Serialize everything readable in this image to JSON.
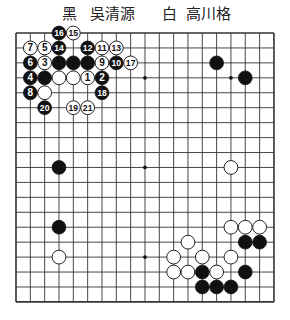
{
  "header": {
    "black_label": "黑",
    "black_player": "吳清源",
    "white_label": "白",
    "white_player": "高川格"
  },
  "board": {
    "size": 19,
    "origin_x": 16,
    "origin_y": 33,
    "spacing_x": 14.33,
    "spacing_y": 14.94,
    "stone_radius": 6.9,
    "line_color": "#333333",
    "star_points": [
      [
        3,
        3
      ],
      [
        9,
        3
      ],
      [
        15,
        3
      ],
      [
        3,
        9
      ],
      [
        9,
        9
      ],
      [
        15,
        9
      ],
      [
        3,
        15
      ],
      [
        9,
        15
      ],
      [
        15,
        15
      ]
    ],
    "stones": [
      {
        "c": 3,
        "r": 0,
        "color": "black",
        "n": "16"
      },
      {
        "c": 4,
        "r": 0,
        "color": "white",
        "n": "15"
      },
      {
        "c": 1,
        "r": 1,
        "color": "white",
        "n": "7"
      },
      {
        "c": 2,
        "r": 1,
        "color": "white",
        "n": "5"
      },
      {
        "c": 3,
        "r": 1,
        "color": "black",
        "n": "14"
      },
      {
        "c": 5,
        "r": 1,
        "color": "black",
        "n": "12"
      },
      {
        "c": 6,
        "r": 1,
        "color": "white",
        "n": "11"
      },
      {
        "c": 7,
        "r": 1,
        "color": "white",
        "n": "13"
      },
      {
        "c": 1,
        "r": 2,
        "color": "black",
        "n": "6"
      },
      {
        "c": 2,
        "r": 2,
        "color": "white",
        "n": "3"
      },
      {
        "c": 3,
        "r": 2,
        "color": "black",
        "n": ""
      },
      {
        "c": 4,
        "r": 2,
        "color": "black",
        "n": ""
      },
      {
        "c": 5,
        "r": 2,
        "color": "black",
        "n": ""
      },
      {
        "c": 6,
        "r": 2,
        "color": "white",
        "n": "9"
      },
      {
        "c": 7,
        "r": 2,
        "color": "black",
        "n": "10"
      },
      {
        "c": 8,
        "r": 2,
        "color": "white",
        "n": "17"
      },
      {
        "c": 1,
        "r": 3,
        "color": "black",
        "n": "4"
      },
      {
        "c": 2,
        "r": 3,
        "color": "black",
        "n": ""
      },
      {
        "c": 3,
        "r": 3,
        "color": "white",
        "n": ""
      },
      {
        "c": 4,
        "r": 3,
        "color": "white",
        "n": ""
      },
      {
        "c": 5,
        "r": 3,
        "color": "white",
        "n": "1"
      },
      {
        "c": 6,
        "r": 3,
        "color": "black",
        "n": "2"
      },
      {
        "c": 1,
        "r": 4,
        "color": "black",
        "n": "8"
      },
      {
        "c": 2,
        "r": 4,
        "color": "white",
        "n": ""
      },
      {
        "c": 6,
        "r": 4,
        "color": "black",
        "n": "18"
      },
      {
        "c": 2,
        "r": 5,
        "color": "black",
        "n": "20"
      },
      {
        "c": 4,
        "r": 5,
        "color": "white",
        "n": "19"
      },
      {
        "c": 5,
        "r": 5,
        "color": "white",
        "n": "21"
      },
      {
        "c": 14,
        "r": 2,
        "color": "black",
        "n": ""
      },
      {
        "c": 16,
        "r": 3,
        "color": "black",
        "n": ""
      },
      {
        "c": 3,
        "r": 9,
        "color": "black",
        "n": ""
      },
      {
        "c": 15,
        "r": 9,
        "color": "white",
        "n": ""
      },
      {
        "c": 3,
        "r": 13,
        "color": "black",
        "n": ""
      },
      {
        "c": 3,
        "r": 15,
        "color": "white",
        "n": ""
      },
      {
        "c": 15,
        "r": 13,
        "color": "white",
        "n": ""
      },
      {
        "c": 16,
        "r": 13,
        "color": "white",
        "n": ""
      },
      {
        "c": 17,
        "r": 13,
        "color": "white",
        "n": ""
      },
      {
        "c": 12,
        "r": 14,
        "color": "white",
        "n": ""
      },
      {
        "c": 16,
        "r": 14,
        "color": "black",
        "n": ""
      },
      {
        "c": 17,
        "r": 14,
        "color": "black",
        "n": ""
      },
      {
        "c": 11,
        "r": 15,
        "color": "white",
        "n": ""
      },
      {
        "c": 13,
        "r": 15,
        "color": "white",
        "n": ""
      },
      {
        "c": 15,
        "r": 15,
        "color": "white",
        "n": ""
      },
      {
        "c": 11,
        "r": 16,
        "color": "white",
        "n": ""
      },
      {
        "c": 12,
        "r": 16,
        "color": "white",
        "n": ""
      },
      {
        "c": 13,
        "r": 16,
        "color": "black",
        "n": ""
      },
      {
        "c": 14,
        "r": 16,
        "color": "white",
        "n": ""
      },
      {
        "c": 16,
        "r": 16,
        "color": "black",
        "n": ""
      },
      {
        "c": 13,
        "r": 17,
        "color": "black",
        "n": ""
      },
      {
        "c": 14,
        "r": 17,
        "color": "black",
        "n": ""
      },
      {
        "c": 15,
        "r": 17,
        "color": "black",
        "n": ""
      }
    ]
  }
}
